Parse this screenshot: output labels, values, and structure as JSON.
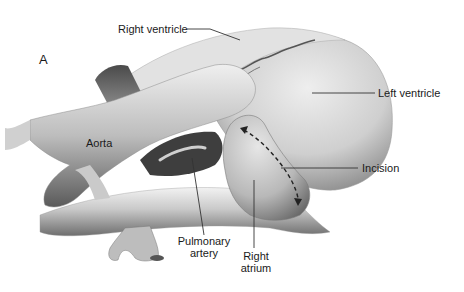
{
  "figure": {
    "panel_letter": "A",
    "labels": {
      "right_ventricle": "Right ventricle",
      "left_ventricle": "Left ventricle",
      "aorta": "Aorta",
      "incision": "Incision",
      "pulmonary_artery_line1": "Pulmonary",
      "pulmonary_artery_line2": "artery",
      "right_atrium_line1": "Right",
      "right_atrium_line2": "atrium"
    },
    "colors": {
      "background": "#ffffff",
      "text": "#1a1a1a",
      "leader_line": "#333333"
    }
  }
}
